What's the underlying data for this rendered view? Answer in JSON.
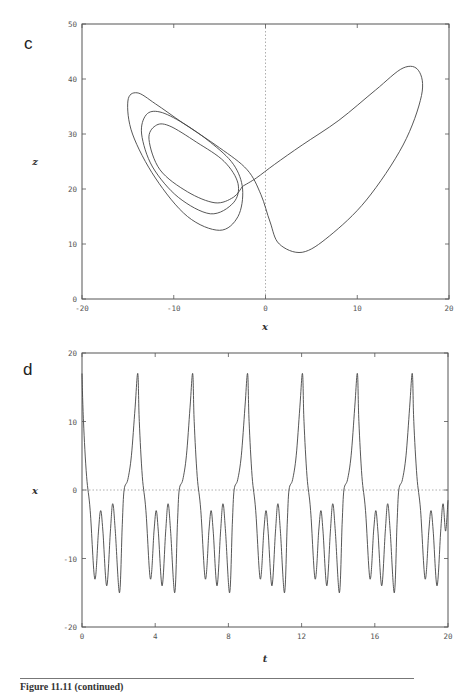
{
  "panels": {
    "c": {
      "label": "c"
    },
    "d": {
      "label": "d"
    }
  },
  "caption": "Figure 11.11 (continued)",
  "chart_data": [
    {
      "panel": "c",
      "type": "line",
      "title": "",
      "xlabel": "x",
      "ylabel": "z",
      "xlim": [
        -20,
        20
      ],
      "ylim": [
        0,
        50
      ],
      "xticks": [
        "-20",
        "-10",
        "0",
        "10",
        "20"
      ],
      "yticks": [
        "0",
        "10",
        "20",
        "30",
        "40",
        "50"
      ],
      "grid": false,
      "reference_lines": [
        {
          "orientation": "vertical",
          "x": 0,
          "style": "dotted"
        }
      ],
      "description": "Phase portrait (x vs z): periodic orbit with three nested loops around the left lobe (x≈-10, z≈28) and one large loop on the right lobe reaching z≈42 at x≈15",
      "series": [
        {
          "name": "trajectory",
          "points": [
            [
              -2.5,
              20.5
            ],
            [
              -1,
              22
            ],
            [
              1,
              24.5
            ],
            [
              4,
              28
            ],
            [
              8,
              32.5
            ],
            [
              12,
              38
            ],
            [
              15,
              42
            ],
            [
              16.7,
              41.5
            ],
            [
              17,
              37
            ],
            [
              15,
              28
            ],
            [
              11,
              18
            ],
            [
              7,
              11.5
            ],
            [
              4,
              8.5
            ],
            [
              1.5,
              10
            ],
            [
              0.5,
              14
            ],
            [
              -0.5,
              19
            ],
            [
              -2,
              23.5
            ],
            [
              -5,
              27.5
            ],
            [
              -9,
              32
            ],
            [
              -12,
              35.5
            ],
            [
              -14,
              37.5
            ],
            [
              -15,
              36
            ],
            [
              -14.5,
              30
            ],
            [
              -12,
              22
            ],
            [
              -8.5,
              15
            ],
            [
              -5,
              12.5
            ],
            [
              -3,
              15
            ],
            [
              -2.5,
              20
            ],
            [
              -3.5,
              24.5
            ],
            [
              -6,
              28.5
            ],
            [
              -9,
              32
            ],
            [
              -11.5,
              34
            ],
            [
              -13,
              33.5
            ],
            [
              -13.5,
              30
            ],
            [
              -12.3,
              24
            ],
            [
              -9.5,
              18.5
            ],
            [
              -6,
              15.5
            ],
            [
              -3.5,
              17.5
            ],
            [
              -3,
              21
            ],
            [
              -4.5,
              25
            ],
            [
              -7.5,
              28.5
            ],
            [
              -10.5,
              31.5
            ],
            [
              -12,
              31.5
            ],
            [
              -12.7,
              29
            ],
            [
              -11.5,
              23.5
            ],
            [
              -8.5,
              19.5
            ],
            [
              -5.5,
              17.5
            ],
            [
              -3.5,
              18.5
            ],
            [
              -2.5,
              20.5
            ]
          ]
        }
      ]
    },
    {
      "panel": "d",
      "type": "line",
      "title": "",
      "xlabel": "t",
      "ylabel": "x",
      "xlim": [
        0,
        20
      ],
      "ylim": [
        -20,
        20
      ],
      "xticks": [
        "0",
        "4",
        "8",
        "12",
        "16",
        "20"
      ],
      "yticks": [
        "-20",
        "-10",
        "0",
        "10",
        "20"
      ],
      "grid": false,
      "reference_lines": [
        {
          "orientation": "horizontal",
          "y": 0,
          "style": "dotted"
        }
      ],
      "description": "Time series x(t): periodic with period ≈3.05; each period has one spike to ≈17 followed by three dips to ≈-13, -14, -15",
      "period": 3.05,
      "peak_times": [
        0,
        3.05,
        6.05,
        9.05,
        12.05,
        15.05,
        18.05
      ],
      "peak_value": 17,
      "dip_values": [
        -13,
        -14,
        -15
      ],
      "one_period_points": [
        [
          0.0,
          17
        ],
        [
          0.08,
          10
        ],
        [
          0.25,
          2
        ],
        [
          0.45,
          -3
        ],
        [
          0.7,
          -13
        ],
        [
          0.9,
          -6
        ],
        [
          1.02,
          -3
        ],
        [
          1.14,
          -6
        ],
        [
          1.35,
          -14
        ],
        [
          1.55,
          -6
        ],
        [
          1.68,
          -2
        ],
        [
          1.82,
          -6
        ],
        [
          2.05,
          -15
        ],
        [
          2.2,
          -5
        ],
        [
          2.3,
          0
        ],
        [
          2.5,
          1.5
        ],
        [
          2.7,
          5
        ],
        [
          2.9,
          12
        ],
        [
          3.05,
          17
        ]
      ]
    }
  ]
}
